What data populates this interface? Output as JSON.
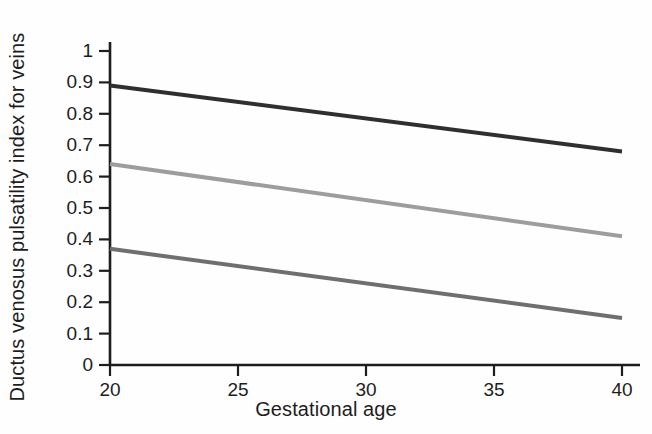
{
  "chart_data": {
    "type": "line",
    "title": "",
    "xlabel": "Gestational age",
    "ylabel": "Ductus venosus pulsatility index for veins",
    "xlim": [
      20,
      40
    ],
    "ylim": [
      0,
      1
    ],
    "x_ticks": [
      "20",
      "25",
      "30",
      "35",
      "40"
    ],
    "x_tick_values": [
      20,
      25,
      30,
      35,
      40
    ],
    "y_ticks": [
      "0",
      "0.1",
      "0.2",
      "0.3",
      "0.4",
      "0.5",
      "0.6",
      "0.7",
      "0.8",
      "0.9",
      "1"
    ],
    "y_tick_values": [
      0,
      0.1,
      0.2,
      0.3,
      0.4,
      0.5,
      0.6,
      0.7,
      0.8,
      0.9,
      1
    ],
    "grid": false,
    "legend": "none",
    "x": [
      20,
      40
    ],
    "series": [
      {
        "name": "upper-reference-line",
        "values": [
          0.89,
          0.68
        ],
        "color": "#2f2f2f",
        "width": 4
      },
      {
        "name": "middle-reference-line",
        "values": [
          0.64,
          0.41
        ],
        "color": "#9d9d9d",
        "width": 4
      },
      {
        "name": "lower-reference-line",
        "values": [
          0.37,
          0.15
        ],
        "color": "#6f6f6f",
        "width": 4
      }
    ]
  },
  "style": {
    "axis_color": "#1d1d1d",
    "text_color": "#1d1d1d",
    "background": "#fefefe"
  }
}
